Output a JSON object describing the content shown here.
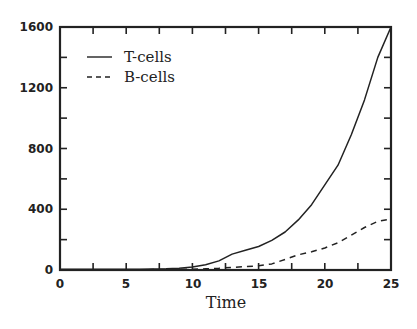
{
  "chart_data": {
    "type": "line",
    "title": "",
    "xlabel": "Time",
    "ylabel": "",
    "xlim": [
      0,
      25
    ],
    "ylim": [
      0,
      1600
    ],
    "grid": false,
    "legend_position": "upper left",
    "x_ticks": [
      0,
      5,
      10,
      15,
      20,
      25
    ],
    "y_ticks": [
      0,
      400,
      800,
      1200,
      1600
    ],
    "x_tick_labels": [
      "0",
      "5",
      "10",
      "15",
      "20",
      "25"
    ],
    "y_tick_labels": [
      "0",
      "400",
      "800",
      "1200",
      "1600"
    ],
    "series": [
      {
        "name": "T-cells",
        "style": "solid",
        "x": [
          0,
          2,
          4,
          6,
          8,
          9,
          10,
          11,
          12,
          13,
          14,
          15,
          16,
          17,
          18,
          19,
          20,
          21,
          22,
          23,
          24,
          25
        ],
        "values": [
          5,
          5,
          5,
          5,
          8,
          12,
          20,
          35,
          60,
          105,
          130,
          155,
          195,
          250,
          330,
          430,
          560,
          690,
          890,
          1120,
          1400,
          1600
        ]
      },
      {
        "name": "B-cells",
        "style": "dashed",
        "x": [
          0,
          2,
          4,
          6,
          8,
          10,
          11,
          12,
          13,
          14,
          15,
          16,
          17,
          18,
          19,
          20,
          21,
          22,
          23,
          24,
          25
        ],
        "values": [
          2,
          2,
          2,
          2,
          3,
          5,
          8,
          12,
          18,
          22,
          28,
          40,
          70,
          100,
          120,
          145,
          180,
          230,
          280,
          320,
          335
        ]
      }
    ]
  },
  "labels": {
    "xlabel": "Time",
    "legend": [
      "T-cells",
      "B-cells"
    ],
    "x_ticks": [
      "0",
      "5",
      "10",
      "15",
      "20",
      "25"
    ],
    "y_ticks": [
      "0",
      "400",
      "800",
      "1200",
      "1600"
    ]
  }
}
